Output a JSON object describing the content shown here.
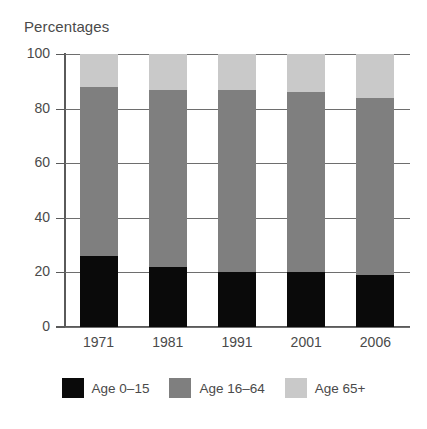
{
  "chart_data": {
    "type": "bar",
    "subtype": "stacked-bar-100",
    "title": "Percentages",
    "xlabel": "",
    "ylabel": "Percentages",
    "ylim": [
      0,
      100
    ],
    "yticks": [
      0,
      20,
      40,
      60,
      80,
      100
    ],
    "ytick_labels": [
      "0",
      "20",
      "40",
      "60",
      "80",
      "100"
    ],
    "grid": true,
    "grid_axis": "y",
    "legend_position": "bottom",
    "categories": [
      "1971",
      "1981",
      "1991",
      "2001",
      "2006"
    ],
    "series": [
      {
        "name": "Age 0–15",
        "color": "#0a0a0a",
        "values": [
          26,
          22,
          20,
          20,
          19
        ]
      },
      {
        "name": "Age 16–64",
        "color": "#7f7f7f",
        "values": [
          62,
          65,
          67,
          66,
          65
        ]
      },
      {
        "name": "Age 65+",
        "color": "#c9c9c9",
        "values": [
          12,
          13,
          13,
          14,
          16
        ]
      }
    ],
    "cumulative_tops": {
      "age_0_15": [
        26,
        22,
        20,
        20,
        19
      ],
      "age_16_64": [
        88,
        87,
        87,
        86,
        84
      ],
      "age_65_plus": [
        100,
        100,
        100,
        100,
        100
      ]
    }
  },
  "legend": {
    "items": [
      {
        "label": "Age 0–15",
        "color": "#0a0a0a",
        "swatch_name": "legend-swatch-age-0-15"
      },
      {
        "label": "Age 16–64",
        "color": "#7f7f7f",
        "swatch_name": "legend-swatch-age-16-64"
      },
      {
        "label": "Age 65+",
        "color": "#c9c9c9",
        "swatch_name": "legend-swatch-age-65-plus"
      }
    ]
  },
  "colors": {
    "axis": "#5a5a5a",
    "gridline": "#6e6e6e",
    "text": "#4a4a4a",
    "background": "#ffffff"
  }
}
